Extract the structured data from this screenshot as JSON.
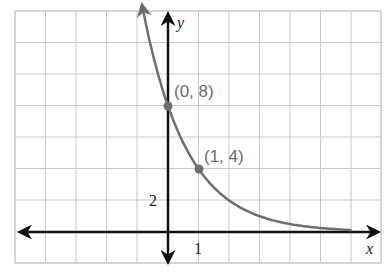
{
  "chart_data": {
    "type": "line",
    "title": "",
    "function": "y = 8(1/2)^x",
    "xlabel": "x",
    "ylabel": "y",
    "x_tick_label": "1",
    "y_tick_label": "2",
    "xlim": [
      -5,
      7
    ],
    "ylim": [
      -2,
      14
    ],
    "grid": true,
    "x_step": 1,
    "y_step": 2,
    "points": [
      {
        "x": 0,
        "y": 8,
        "label": "(0, 8)"
      },
      {
        "x": 1,
        "y": 4,
        "label": "(1, 4)"
      }
    ],
    "curve_color": "#6e6e6e",
    "axis_color": "#111111",
    "grid_color": "#c8c8c8"
  }
}
